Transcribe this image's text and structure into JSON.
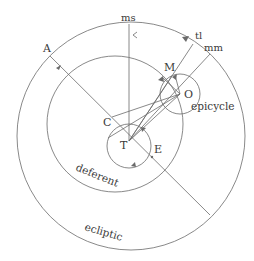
{
  "diagram": {
    "type": "ptolemaic-planetary-model",
    "stroke_color": "#6b6b6b",
    "text_color": "#3a3a3a",
    "background": "#ffffff",
    "points": {
      "A": "A",
      "C": "C",
      "T": "T",
      "E": "E",
      "M": "M",
      "O": "O",
      "ms": "ms",
      "tl": "tl",
      "mm": "mm"
    },
    "circle_labels": {
      "epicycle": "epicycle",
      "deferent": "deferent",
      "ecliptic": "ecliptic"
    }
  }
}
